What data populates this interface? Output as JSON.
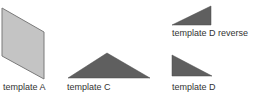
{
  "templates": [
    {
      "id": "A",
      "label": "template A",
      "shape": "parallelogram",
      "fill": "#c4c4c4",
      "stroke": "#7a7a7a"
    },
    {
      "id": "C",
      "label": "template C",
      "shape": "isosceles-triangle",
      "fill": "#5f5f5f",
      "stroke": "#4a4a4a"
    },
    {
      "id": "D_reverse",
      "label": "template D reverse",
      "shape": "right-triangle-reverse",
      "fill": "#5f5f5f",
      "stroke": "#4a4a4a"
    },
    {
      "id": "D",
      "label": "template D",
      "shape": "right-triangle",
      "fill": "#5f5f5f",
      "stroke": "#4a4a4a"
    }
  ]
}
